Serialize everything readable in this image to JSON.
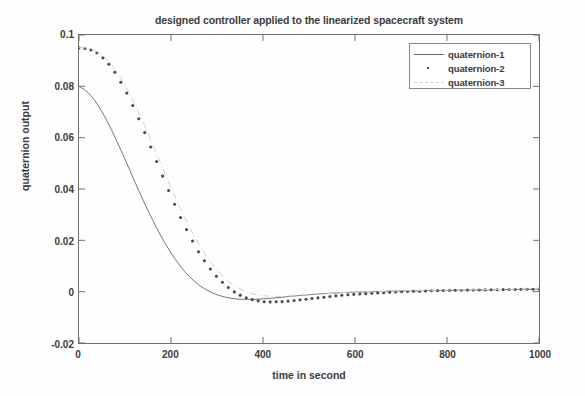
{
  "chart_data": {
    "type": "line",
    "title": "designed controller applied to the linearized spacecraft system",
    "xlabel": "time in second",
    "ylabel": "quaternion output",
    "xlim": [
      0,
      1000
    ],
    "ylim": [
      -0.02,
      0.1
    ],
    "xticks": [
      0,
      200,
      400,
      600,
      800,
      1000
    ],
    "xtick_labels": [
      "0",
      "200",
      "400",
      "600",
      "800",
      "1000"
    ],
    "yticks": [
      -0.02,
      0,
      0.02,
      0.04,
      0.06,
      0.08,
      0.1
    ],
    "ytick_labels": [
      "-0.02",
      "0",
      "0.02",
      "0.04",
      "0.06",
      "0.08",
      "0.1"
    ],
    "grid": false,
    "legend_position": "upper right",
    "x": [
      0,
      20,
      40,
      60,
      80,
      100,
      120,
      140,
      160,
      180,
      200,
      220,
      240,
      260,
      280,
      300,
      320,
      340,
      360,
      380,
      400,
      420,
      440,
      460,
      480,
      500,
      520,
      540,
      560,
      580,
      600,
      640,
      680,
      720,
      760,
      800,
      840,
      880,
      920,
      960,
      1000
    ],
    "series": [
      {
        "name": "quaternion-1",
        "style": "solid",
        "values": [
          0.08,
          0.0775,
          0.073,
          0.0668,
          0.0595,
          0.0516,
          0.0434,
          0.0354,
          0.0279,
          0.0211,
          0.0151,
          0.01,
          0.0059,
          0.0027,
          0.0004,
          -0.0012,
          -0.0022,
          -0.0028,
          -0.003,
          -0.003,
          -0.0028,
          -0.0025,
          -0.0022,
          -0.0018,
          -0.0015,
          -0.0012,
          -0.0009,
          -0.0007,
          -0.0005,
          -0.0003,
          -0.0002,
          0.0,
          0.0002,
          0.0003,
          0.0004,
          0.0005,
          0.0006,
          0.0007,
          0.0008,
          0.0009,
          0.001
        ]
      },
      {
        "name": "quaternion-2",
        "style": "dotted",
        "values": [
          0.095,
          0.0946,
          0.093,
          0.0898,
          0.085,
          0.0788,
          0.0714,
          0.0632,
          0.0546,
          0.0458,
          0.0372,
          0.0292,
          0.0219,
          0.0155,
          0.0101,
          0.0057,
          0.0022,
          -0.0004,
          -0.0022,
          -0.0033,
          -0.0039,
          -0.004,
          -0.0039,
          -0.0036,
          -0.0032,
          -0.0028,
          -0.0024,
          -0.002,
          -0.0016,
          -0.0013,
          -0.001,
          -0.0006,
          -0.0002,
          0.0001,
          0.0003,
          0.0005,
          0.0006,
          0.0007,
          0.0008,
          0.0009,
          0.001
        ]
      },
      {
        "name": "quaternion-3",
        "style": "dash-dot",
        "values": [
          0.0952,
          0.0948,
          0.0934,
          0.0906,
          0.0862,
          0.0804,
          0.0735,
          0.0657,
          0.0574,
          0.0489,
          0.0405,
          0.0325,
          0.0252,
          0.0187,
          0.0131,
          0.0085,
          0.0048,
          0.0021,
          0.0002,
          -0.001,
          -0.0016,
          -0.0018,
          -0.0018,
          -0.0016,
          -0.0014,
          -0.0011,
          -0.0009,
          -0.0007,
          -0.0005,
          -0.0003,
          -0.0002,
          0.0,
          0.0002,
          0.0004,
          0.0005,
          0.0006,
          0.0007,
          0.0008,
          0.0009,
          0.001,
          0.0011
        ]
      }
    ],
    "legend_entries": [
      {
        "label": "quaternion-1",
        "style": "solid"
      },
      {
        "label": "quaternion-2",
        "style": "dotted"
      },
      {
        "label": "quaternion-3",
        "style": "dash-dot"
      }
    ],
    "colors": {
      "axis": "#6f6f6f",
      "text": "#3b3b3b",
      "series_1": "#666666",
      "series_2": "#4a4a4a",
      "series_3": "#cfcfcf",
      "background": "#fefefe"
    }
  }
}
